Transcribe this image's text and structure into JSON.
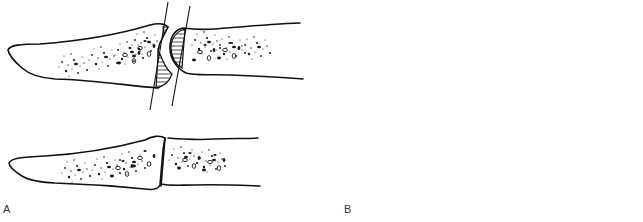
{
  "figure": {
    "colors": {
      "stroke": "#111111",
      "background": "#ffffff",
      "label": "#333333"
    },
    "panels": [
      {
        "id": "A",
        "label": "A",
        "technique": "flat cut",
        "rows": [
          {
            "stage": "before",
            "elements": [
              "distal-bone",
              "proximal-bone",
              "hatched-resection-distal",
              "hatched-resection-proximal",
              "cut-line-1",
              "cut-line-2"
            ]
          },
          {
            "stage": "after",
            "elements": [
              "distal-bone",
              "proximal-bone",
              "flat-fusion-line"
            ]
          }
        ]
      },
      {
        "id": "B",
        "label": "B",
        "technique": "cup-and-cone",
        "rows": [
          {
            "stage": "before",
            "elements": [
              "distal-bone-cup",
              "proximal-bone-cone",
              "hatched-resection-cup",
              "hatched-resection-cone"
            ]
          },
          {
            "stage": "after",
            "elements": [
              "distal-bone-cup",
              "proximal-bone-cone",
              "curved-fusion-line"
            ]
          }
        ]
      }
    ]
  }
}
